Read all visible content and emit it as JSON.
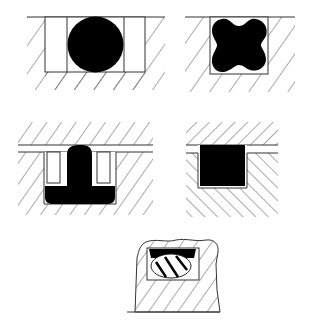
{
  "figure": {
    "colors": {
      "background": "#ffffff",
      "line": "#333333",
      "seal_fill": "#000000",
      "hatch": "#444444"
    },
    "panels": [
      {
        "id": "o-ring",
        "label": "O-ring seal in rectangular groove with backup rings"
      },
      {
        "id": "x-ring",
        "label": "X-ring (quad ring) seal in rectangular groove"
      },
      {
        "id": "t-seal",
        "label": "T-seal with backup rings"
      },
      {
        "id": "square-ring",
        "label": "Square-section seal in groove"
      },
      {
        "id": "capped-seal",
        "label": "Capped seal with energizing O-ring in groove"
      }
    ]
  }
}
